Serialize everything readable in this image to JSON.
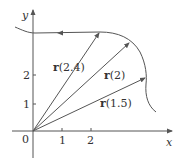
{
  "figure": {
    "axes": {
      "x_label": "x",
      "y_label": "y",
      "origin_label": "0",
      "x_ticks": [
        "1",
        "2"
      ],
      "y_ticks": [
        "1",
        "2"
      ]
    },
    "vectors": [
      {
        "name": "r",
        "arg": "(2.4)",
        "label": "r(2.4)"
      },
      {
        "name": "r",
        "arg": "(2)",
        "label": "r(2)"
      },
      {
        "name": "r",
        "arg": "(1.5)",
        "label": "r(1.5)"
      }
    ],
    "colors": {
      "line": "#555555",
      "text": "#333333",
      "background": "#ffffff"
    }
  }
}
